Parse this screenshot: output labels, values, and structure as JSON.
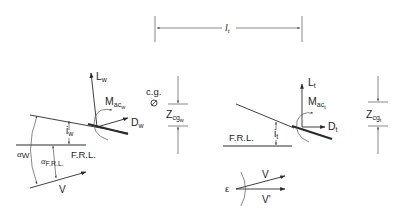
{
  "diagram": {
    "type": "aircraft wing-tail force and moment diagram",
    "dimension_top": {
      "symbol": "l",
      "subscript": "t"
    },
    "cg_label": "c.g.",
    "cg_symbol": "⊘",
    "wing": {
      "lift": {
        "symbol": "L",
        "subscript": "w"
      },
      "moment": {
        "symbol": "M",
        "subscript": "ac",
        "subsubscript": "w"
      },
      "drag": {
        "symbol": "D",
        "subscript": "w"
      },
      "incidence": {
        "symbol": "i",
        "subscript": "w"
      },
      "frl_label": "F.R.L.",
      "alpha_w": {
        "symbol": "α",
        "subscript": "W"
      },
      "alpha_frl": {
        "symbol": "α",
        "subscript": "F.R.L."
      },
      "velocity": "V",
      "zcg": {
        "symbol": "Z",
        "subscript": "cg",
        "subsubscript": "w"
      }
    },
    "tail": {
      "lift": {
        "symbol": "L",
        "subscript": "t"
      },
      "moment": {
        "symbol": "M",
        "subscript": "ac",
        "subsubscript": "t"
      },
      "drag": {
        "symbol": "D",
        "subscript": "t"
      },
      "incidence": {
        "symbol": "i",
        "subscript": "t"
      },
      "frl_label": "F.R.L.",
      "zcg": {
        "symbol": "Z",
        "subscript": "cg",
        "subsubscript": "t"
      }
    },
    "downwash": {
      "epsilon": "ε",
      "velocity": "V",
      "velocity_prime": "V'"
    }
  }
}
